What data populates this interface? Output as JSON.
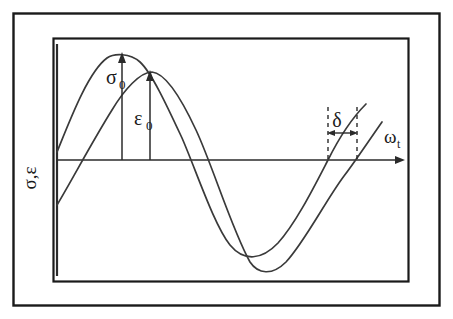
{
  "figure": {
    "background_color": "#ffffff",
    "line_color": "#2b2b2b",
    "frame": {
      "outer_border": {
        "x": 13,
        "y": 13,
        "width": 427,
        "height": 293
      },
      "inner_border": {
        "x": 53,
        "y": 38,
        "width": 356,
        "height": 244
      }
    }
  },
  "axes": {
    "y_axis_label": "σ,ε",
    "x_axis_label": "ω",
    "x_axis_label_subscript": "t",
    "baseline_y": 160,
    "x_axis_arrow_end_x": 405,
    "vertical_axis_x": 57
  },
  "annotations": {
    "stress_amplitude_label": "σ",
    "stress_amplitude_subscript": "0",
    "strain_amplitude_label": "ε",
    "strain_amplitude_subscript": "0",
    "phase_lag_label": "δ",
    "stress_arrow_x": 122,
    "stress_peak_y": 54,
    "strain_arrow_x": 150,
    "strain_peak_y": 72,
    "delta_left_x": 328,
    "delta_right_x": 357,
    "delta_dash_top_y": 107,
    "delta_arrow_y": 133
  },
  "chart_data": {
    "type": "line",
    "xlabel": "ωt",
    "ylabel": "σ,ε",
    "grid": false,
    "legend": "none",
    "xlim": [
      0,
      405
    ],
    "ylim": [
      -105,
      110
    ],
    "series": [
      {
        "name": "σ (stress)",
        "amplitude": 106,
        "phase_lead_px": 29,
        "peak": {
          "x": 122,
          "y": 54
        },
        "trough": {
          "x": 230,
          "y": 245
        },
        "zero_crossing_falling_x": 101,
        "zero_crossing_rising_x": 328,
        "start_point": {
          "x": 57,
          "y": 152
        },
        "path": "M 57,152 C 70,120 88,72 107,58 C 114,53 130,53 140,62 C 152,73 168,108 182,138 C 196,170 214,225 230,245 C 244,262 262,260 278,243 C 296,223 314,187 328,160 C 338,140 352,118 366,104"
      },
      {
        "name": "ε (strain)",
        "amplitude": 88,
        "phase_lead_px": 0,
        "peak": {
          "x": 150,
          "y": 72
        },
        "trough": {
          "x": 258,
          "y": 267
        },
        "zero_crossing_falling_x": 120,
        "zero_crossing_rising_x": 357,
        "start_point": {
          "x": 57,
          "y": 205
        },
        "path": "M 57,205 C 72,180 92,142 112,110 C 124,90 140,72 152,72 C 166,73 182,100 196,130 C 212,164 232,230 250,262 C 258,274 272,276 286,262 C 304,243 326,200 344,176 C 352,166 368,142 382,122"
      }
    ],
    "annotations": [
      {
        "text": "σ0",
        "type": "amplitude-arrow",
        "x": 122,
        "from_y": 160,
        "to_y": 56
      },
      {
        "text": "ε0",
        "type": "amplitude-arrow",
        "x": 150,
        "from_y": 160,
        "to_y": 74
      },
      {
        "text": "δ",
        "type": "phase-lag-span",
        "from_x": 328,
        "to_x": 357,
        "y": 133
      }
    ]
  }
}
